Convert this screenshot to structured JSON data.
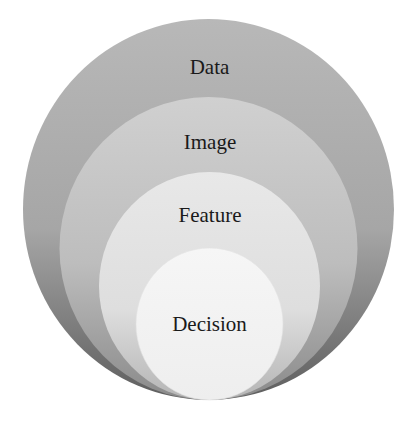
{
  "diagram": {
    "type": "nested-circles",
    "layers": [
      {
        "label": "Data",
        "fill_top": "#b4b4b4",
        "fill_bottom": "#6e6e6e"
      },
      {
        "label": "Image",
        "fill_top": "#cdcdcd",
        "fill_bottom": "#959595"
      },
      {
        "label": "Feature",
        "fill_top": "#e6e6e6",
        "fill_bottom": "#bdbdbd"
      },
      {
        "label": "Decision",
        "fill_top": "#f5f5f5",
        "fill_bottom": "#eeeeee"
      }
    ]
  }
}
